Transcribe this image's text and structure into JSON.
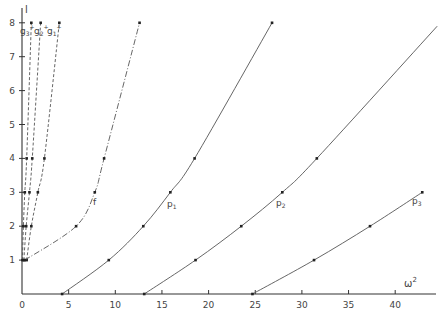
{
  "chart_data": {
    "type": "line",
    "title": "",
    "xlabel": "ω²",
    "ylabel": "l",
    "xlim": [
      0,
      43
    ],
    "ylim": [
      0,
      8.4
    ],
    "xticks": [
      0,
      5,
      10,
      15,
      20,
      25,
      30,
      35,
      40
    ],
    "yticks": [
      1,
      2,
      3,
      4,
      5,
      6,
      7,
      8
    ],
    "grid": false,
    "legend": "inline labels on curves",
    "series": [
      {
        "name": "g3+",
        "label": "g₃⁺",
        "style": "dashed",
        "points": [
          [
            0.05,
            1
          ],
          [
            0.15,
            2
          ],
          [
            0.3,
            3
          ],
          [
            0.5,
            4
          ],
          [
            1.0,
            8
          ]
        ]
      },
      {
        "name": "g2+",
        "label": "g₂⁺",
        "style": "dashed",
        "points": [
          [
            0.2,
            1
          ],
          [
            0.45,
            2
          ],
          [
            0.8,
            3
          ],
          [
            1.1,
            4
          ],
          [
            2.0,
            8
          ]
        ]
      },
      {
        "name": "g1+",
        "label": "g₁⁺",
        "style": "dashed",
        "points": [
          [
            0.5,
            1
          ],
          [
            1.0,
            2
          ],
          [
            1.7,
            3
          ],
          [
            2.4,
            4
          ],
          [
            4.0,
            8
          ]
        ]
      },
      {
        "name": "f",
        "label": "f",
        "style": "dash-dot",
        "points": [
          [
            0.3,
            1
          ],
          [
            5.8,
            2
          ],
          [
            7.8,
            3
          ],
          [
            8.8,
            4
          ],
          [
            12.6,
            8
          ]
        ]
      },
      {
        "name": "p1",
        "label": "p₁",
        "style": "solid",
        "points": [
          [
            4.3,
            0
          ],
          [
            9.3,
            1
          ],
          [
            13.0,
            2
          ],
          [
            15.9,
            3
          ],
          [
            18.5,
            4
          ],
          [
            26.8,
            8
          ]
        ]
      },
      {
        "name": "p2",
        "label": "p₂",
        "style": "solid",
        "points": [
          [
            13.1,
            0
          ],
          [
            18.6,
            1
          ],
          [
            23.5,
            2
          ],
          [
            27.9,
            3
          ],
          [
            31.6,
            4
          ],
          [
            44.5,
            7.9
          ]
        ]
      },
      {
        "name": "p3",
        "label": "p₃",
        "style": "solid",
        "points": [
          [
            24.7,
            0
          ],
          [
            31.3,
            1
          ],
          [
            37.3,
            2
          ],
          [
            42.9,
            3
          ]
        ]
      }
    ]
  },
  "axes": {
    "x_label": "ω",
    "x_label_sup": "2",
    "y_label": "l",
    "x_tick_labels": [
      "0",
      "5",
      "10",
      "15",
      "20",
      "25",
      "30",
      "35",
      "40"
    ],
    "y_tick_labels": [
      "1",
      "2",
      "3",
      "4",
      "5",
      "6",
      "7",
      "8"
    ]
  },
  "labels": {
    "g3": "g",
    "g3_sub": "3",
    "g3_sup": "+",
    "g2": "g",
    "g2_sub": "2",
    "g2_sup": "+",
    "g1": "g",
    "g1_sub": "1",
    "g1_sup": "+",
    "f": "f",
    "p1": "p",
    "p1_sub": "1",
    "p2": "p",
    "p2_sub": "2",
    "p3": "p",
    "p3_sub": "3"
  },
  "colors": {
    "line": "#555555",
    "axis": "#333333",
    "marker": "#222222"
  }
}
